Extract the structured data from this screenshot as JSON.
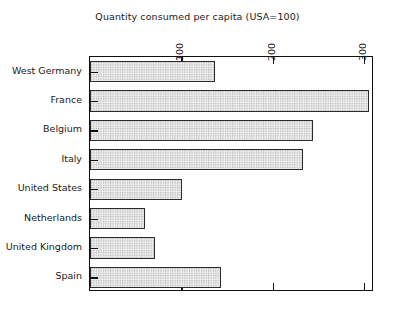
{
  "chart_data": {
    "type": "bar",
    "orientation": "horizontal",
    "title": "Quantity consumed per capita (USA=100)",
    "xlabel": "",
    "ylabel": "",
    "categories": [
      "West Germany",
      "France",
      "Belgium",
      "Italy",
      "United States",
      "Netherlands",
      "United Kingdom",
      "Spain"
    ],
    "values": [
      137,
      305,
      244,
      233,
      101,
      60,
      71,
      143
    ],
    "xlim": [
      0,
      311
    ],
    "xticks": [
      100,
      200,
      300
    ],
    "xtick_labels": [
      "100",
      "200",
      "300"
    ],
    "xaxis_position": "top",
    "xtick_label_rotation": -90,
    "grid": false,
    "legend": false,
    "bar_fill_color": "#ececec",
    "bar_edge_color": "#2b2b2b",
    "frame_color": "#111111",
    "background_color": "#ffffff"
  }
}
